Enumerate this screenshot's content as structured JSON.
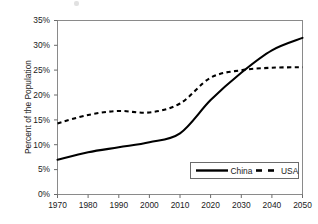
{
  "chart_data": {
    "type": "line",
    "title": "",
    "subtitle": "",
    "xlabel": "",
    "ylabel": "Percent of the Population",
    "x": [
      1970,
      1980,
      1990,
      2000,
      2010,
      2020,
      2030,
      2040,
      2050
    ],
    "xtick_labels": [
      "1970",
      "1980",
      "1990",
      "2000",
      "2010",
      "2020",
      "2030",
      "2040",
      "2050"
    ],
    "ytick_labels": [
      "0%",
      "5%",
      "10%",
      "15%",
      "20%",
      "25%",
      "30%",
      "35%"
    ],
    "ytick_values": [
      0,
      5,
      10,
      15,
      20,
      25,
      30,
      35
    ],
    "ylim": [
      0,
      35
    ],
    "xlim": [
      1970,
      2050
    ],
    "grid": false,
    "legend_position": "bottom-right",
    "series": [
      {
        "name": "China",
        "style": "solid",
        "color": "#000000",
        "values": [
          7.0,
          8.5,
          9.5,
          10.5,
          12.3,
          19.0,
          24.5,
          29.0,
          31.5
        ]
      },
      {
        "name": "USA",
        "style": "dashed",
        "color": "#000000",
        "values": [
          14.3,
          16.0,
          16.8,
          16.5,
          18.3,
          23.5,
          25.0,
          25.5,
          25.6
        ]
      }
    ]
  },
  "legend": {
    "entries": [
      {
        "label": "China",
        "style": "solid"
      },
      {
        "label": "USA",
        "style": "dashed"
      }
    ]
  },
  "axis": {
    "y_title": "Percent of the Population"
  }
}
